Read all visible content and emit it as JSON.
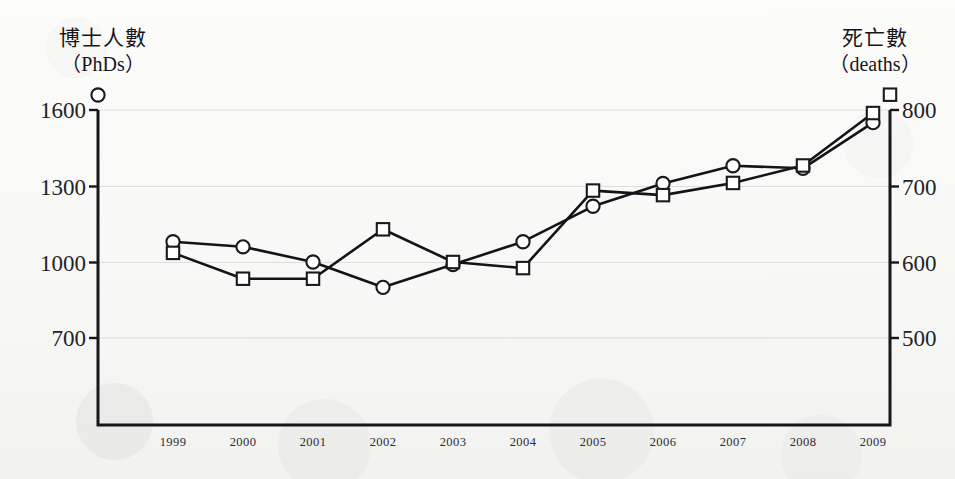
{
  "chart_data": {
    "type": "line",
    "title": "",
    "xlabel": "",
    "categories": [
      "1999",
      "2000",
      "2001",
      "2002",
      "2003",
      "2004",
      "2005",
      "2006",
      "2007",
      "2008",
      "2009"
    ],
    "grid": true,
    "legend_position": "axis-top",
    "series": [
      {
        "name": "博士人數（PhDs）",
        "name_cjk": "博士人數",
        "name_latin": "（PhDs）",
        "axis": "left",
        "marker": "circle",
        "ylabel": "博士人數 (PhDs)",
        "ylim": [
          700,
          1600
        ],
        "yticks": [
          1600,
          1300,
          1000,
          700
        ],
        "values": [
          1080,
          1060,
          1000,
          900,
          990,
          1080,
          1220,
          1310,
          1380,
          1370,
          1550
        ]
      },
      {
        "name": "死亡數（deaths）",
        "name_cjk": "死亡數",
        "name_latin": "（deaths）",
        "axis": "right",
        "marker": "square",
        "ylabel": "死亡數 (deaths)",
        "ylim": [
          500,
          800
        ],
        "yticks": [
          800,
          700,
          600,
          500
        ],
        "values": [
          612,
          578,
          578,
          643,
          600,
          592,
          694,
          688,
          704,
          727,
          796
        ]
      }
    ]
  },
  "left_axis": {
    "title_cjk": "博士人數",
    "title_latin": "（PhDs）",
    "legend_marker": "circle-marker",
    "ticks": [
      "1600",
      "1300",
      "1000",
      "700"
    ]
  },
  "right_axis": {
    "title_cjk": "死亡數",
    "title_latin": "（deaths）",
    "legend_marker": "square-marker",
    "ticks": [
      "800",
      "700",
      "600",
      "500"
    ]
  },
  "x_axis": {
    "labels": [
      "1999",
      "2000",
      "2001",
      "2002",
      "2003",
      "2004",
      "2005",
      "2006",
      "2007",
      "2008",
      "2009"
    ]
  },
  "colors": {
    "line": "#141418",
    "marker_fill": "#ffffff",
    "marker_stroke": "#1a1a1e",
    "grid": "#dededc",
    "axis": "#17171b",
    "background": "#fbfbfa",
    "text": "#16161a"
  }
}
